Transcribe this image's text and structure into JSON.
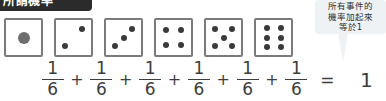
{
  "title_banner": {
    "label": "所謂機率"
  },
  "dice": {
    "faces": [
      {
        "name": "die-face-1",
        "value": 1,
        "pips": [
          [
            50,
            50
          ]
        ],
        "big": true
      },
      {
        "name": "die-face-2",
        "value": 2,
        "pips": [
          [
            73,
            27
          ],
          [
            27,
            73
          ]
        ],
        "big": false
      },
      {
        "name": "die-face-3",
        "value": 3,
        "pips": [
          [
            75,
            25
          ],
          [
            50,
            50
          ],
          [
            25,
            75
          ]
        ],
        "big": false
      },
      {
        "name": "die-face-4",
        "value": 4,
        "pips": [
          [
            29,
            29
          ],
          [
            71,
            29
          ],
          [
            29,
            71
          ],
          [
            71,
            71
          ]
        ],
        "big": false
      },
      {
        "name": "die-face-5",
        "value": 5,
        "pips": [
          [
            27,
            27
          ],
          [
            73,
            27
          ],
          [
            50,
            50
          ],
          [
            27,
            73
          ],
          [
            73,
            73
          ]
        ],
        "big": false
      },
      {
        "name": "die-face-6",
        "value": 6,
        "pips": [
          [
            30,
            24
          ],
          [
            70,
            24
          ],
          [
            30,
            50
          ],
          [
            70,
            50
          ],
          [
            30,
            76
          ],
          [
            70,
            76
          ]
        ],
        "big": false
      }
    ]
  },
  "equation": {
    "terms": [
      {
        "numerator": "1",
        "denominator": "6"
      },
      {
        "numerator": "1",
        "denominator": "6"
      },
      {
        "numerator": "1",
        "denominator": "6"
      },
      {
        "numerator": "1",
        "denominator": "6"
      },
      {
        "numerator": "1",
        "denominator": "6"
      },
      {
        "numerator": "1",
        "denominator": "6"
      }
    ],
    "plus": "+",
    "equals": "=",
    "result": "1"
  },
  "callout": {
    "text": "所有事件的\n機率加起來\n等於1",
    "line1": "所有事件的",
    "line2": "機率加起來",
    "line3": "等於1",
    "background_color": "#eef2f4"
  },
  "colors": {
    "banner_background": "#2b2b2b",
    "banner_text": "#ffffff",
    "die_border": "#7b7b7b",
    "pip": "#3a3a3a",
    "pip_large": "#6d6d6d",
    "equation_text": "#3d3d3d",
    "page_background": "#ffffff"
  }
}
